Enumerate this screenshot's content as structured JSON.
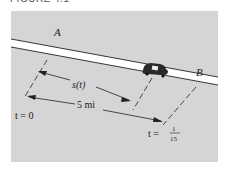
{
  "figure": {
    "caption": "FIGURE 4.1",
    "colors": {
      "panel": "#d5d5d5",
      "road": "#ffffff",
      "ink": "#222222",
      "car": "#2a2a2a"
    }
  },
  "labels": {
    "point_a": "A",
    "point_b": "B",
    "distance_function": "s(t)",
    "total_distance": "5 mi",
    "start_time": "t = 0",
    "end_time_prefix": "t =",
    "end_time_num": "1",
    "end_time_den": "15"
  }
}
